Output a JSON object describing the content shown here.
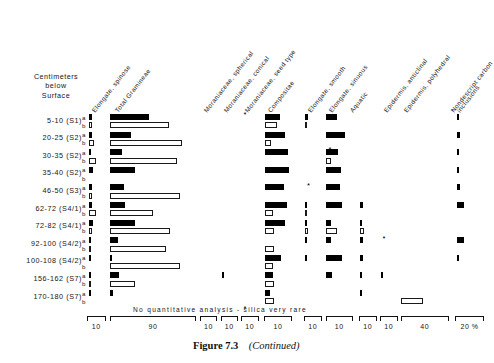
{
  "figure": {
    "caption_label": "Figure 7.3",
    "caption_note": "(Continued)",
    "axis_title": "Centimeters\nbelow\nSurface",
    "axis_title_lines": [
      "Centimeters",
      "below",
      "Surface"
    ],
    "note": "No quantitative analysis - silica very rare",
    "percent_symbol": "%",
    "sub_row_a": "a",
    "sub_row_b": "b"
  },
  "chart_data": {
    "type": "bar",
    "xlabel": "%",
    "ylabel": "Centimeters below Surface",
    "orientation": "horizontal",
    "grid": false,
    "legend": "none",
    "note": "No quantitative analysis - silica very rare",
    "series_note": "Each depth has two sub-samples: a (filled bars) and b (open bars). Values are percent; each column has its own scale given by the bracket width/label beneath it.",
    "columns": [
      {
        "name": "Elongate, spinose",
        "scale_max": 10,
        "bracket_label": "10"
      },
      {
        "name": "Total Gramineae",
        "scale_max": 90,
        "bracket_label": "90"
      },
      {
        "name": "Moraniaceae, spherical",
        "scale_max": 10,
        "bracket_label": "10"
      },
      {
        "name": "Moraniaceae, conical",
        "scale_max": 10,
        "bracket_label": "10"
      },
      {
        "name": "Moraniaceae, seed type",
        "scale_max": 10,
        "bracket_label": "10"
      },
      {
        "name": "Compositae",
        "scale_max": 10,
        "bracket_label": "10"
      },
      {
        "name": "Elongate, smooth",
        "scale_max": 10,
        "bracket_label": "10"
      },
      {
        "name": "Elongate, sinuous",
        "scale_max": 10,
        "bracket_label": "10"
      },
      {
        "name": "Aquatic",
        "scale_max": 10,
        "bracket_label": "10"
      },
      {
        "name": "Epidermis, anticlinal",
        "scale_max": 10,
        "bracket_label": "10"
      },
      {
        "name": "Epidermis, polyhedral",
        "scale_max": 40,
        "bracket_label": "40"
      },
      {
        "name": "Nondescript carbon inclusions",
        "scale_max": 20,
        "bracket_label": "20"
      }
    ],
    "categories": [
      "5-10 (S1)",
      "20-25 (S2)",
      "30-35 (S2)",
      "35-40 (S2)",
      "46-50 (S3)",
      "62-72 (S4/1)",
      "72-82 (S4/1)",
      "92-100 (S4/2)",
      "100-108 (S4/2)",
      "156-162 (S7)",
      "170-180 (S7)"
    ],
    "series": [
      {
        "name": "a",
        "style": "filled",
        "rows": [
          {
            "category": "5-10 (S1)",
            "values": [
              2.0,
              41,
              0,
              0,
              null,
              5.5,
              1.6,
              4.2,
              0,
              0,
              0,
              1.8
            ]
          },
          {
            "category": "20-25 (S2)",
            "values": [
              2.0,
              22,
              0,
              0,
              0,
              7.5,
              0,
              7.0,
              0,
              0,
              0,
              2.6
            ]
          },
          {
            "category": "30-35 (S2)",
            "values": [
              1.6,
              13,
              0,
              0,
              0,
              8.5,
              null,
              4.5,
              0,
              0,
              0,
              1.7
            ]
          },
          {
            "category": "35-40 (S2)",
            "values": [
              2.6,
              26,
              0,
              0,
              0,
              9.0,
              0,
              5.5,
              0,
              0,
              0,
              1.4
            ]
          },
          {
            "category": "46-50 (S3)",
            "values": [
              1.8,
              15,
              0,
              0,
              null,
              7.0,
              0,
              5.0,
              0,
              0,
              0,
              2.2
            ]
          },
          {
            "category": "62-72 (S4/1)",
            "values": [
              1.9,
              16,
              0,
              0,
              0,
              8.0,
              1.5,
              6.0,
              1.6,
              0,
              0,
              5.0
            ]
          },
          {
            "category": "72-82 (S4/1)",
            "values": [
              2.6,
              26,
              0,
              0,
              0,
              7.5,
              1.4,
              1.7,
              1.5,
              null,
              0,
              0
            ]
          },
          {
            "category": "92-100 (S4/2)",
            "values": [
              1.5,
              8,
              0,
              0,
              0,
              0,
              1.5,
              2.0,
              1.6,
              null,
              0,
              5.2
            ]
          },
          {
            "category": "100-108 (S4/2)",
            "values": [
              1.0,
              2,
              0,
              0,
              0,
              6.0,
              1.5,
              6.0,
              1.6,
              0,
              0,
              1.8
            ]
          },
          {
            "category": "156-162 (S7)",
            "values": [
              1.4,
              9,
              0,
              1.0,
              0,
              3.0,
              0,
              2.2,
              1.2,
              1.4,
              0,
              0
            ]
          },
          {
            "category": "170-180 (S7)",
            "values": [
              1.2,
              3,
              0,
              0,
              null,
              1.8,
              0,
              0,
              1.2,
              0,
              0,
              0
            ]
          }
        ]
      },
      {
        "name": "b",
        "style": "open",
        "rows": [
          {
            "category": "5-10 (S1)",
            "values": [
              2.0,
              61,
              0,
              0,
              0,
              4.5,
              1.4,
              0,
              0,
              0,
              0,
              0
            ]
          },
          {
            "category": "20-25 (S2)",
            "values": [
              3.0,
              75,
              0,
              0,
              0,
              2.2,
              0,
              0,
              0,
              0,
              0,
              0
            ]
          },
          {
            "category": "30-35 (S2)",
            "values": [
              4.2,
              70,
              0,
              0,
              0,
              0,
              0,
              2.0,
              0,
              0,
              0,
              0
            ]
          },
          {
            "category": "35-40 (S2)",
            "values": [
              0,
              0,
              0,
              0,
              0,
              0,
              0,
              0,
              0,
              0,
              0,
              0
            ]
          },
          {
            "category": "46-50 (S3)",
            "values": [
              2.0,
              73,
              0,
              0,
              0,
              0,
              0,
              0,
              0,
              0,
              0,
              0
            ]
          },
          {
            "category": "62-72 (S4/1)",
            "values": [
              3.8,
              45,
              0,
              0,
              0,
              3.0,
              1.5,
              0,
              0,
              0,
              0,
              0
            ]
          },
          {
            "category": "72-82 (S4/1)",
            "values": [
              2.0,
              63,
              0,
              0,
              0,
              3.5,
              1.6,
              4.0,
              2.5,
              0,
              0,
              0
            ]
          },
          {
            "category": "92-100 (S4/2)",
            "values": [
              1.2,
              58,
              0,
              0,
              0,
              3.5,
              0,
              0,
              0,
              0,
              0,
              0
            ]
          },
          {
            "category": "100-108 (S4/2)",
            "values": [
              0,
              73,
              0,
              0,
              0,
              3.0,
              0,
              0,
              0,
              0,
              0,
              0
            ]
          },
          {
            "category": "156-162 (S7)",
            "values": [
              1.2,
              26,
              0,
              0,
              0,
              3.5,
              0,
              0,
              0,
              0,
              0,
              0
            ]
          },
          {
            "category": "170-180 (S7)",
            "values": [
              0,
              0,
              0,
              0,
              0,
              3.5,
              0,
              0,
              0,
              0,
              18,
              0
            ]
          }
        ]
      }
    ],
    "markers": [
      {
        "symbol": "*",
        "column": "Moraniaceae, seed type",
        "category": "5-10 (S1)",
        "row": "a"
      },
      {
        "symbol": "*",
        "column": "Elongate, smooth",
        "category": "46-50 (S3)",
        "row": "a"
      },
      {
        "symbol": "*",
        "column": "Elongate, sinuous",
        "category": "30-35 (S2)",
        "row": "a"
      },
      {
        "symbol": "*",
        "column": "Epidermis, anticlinal",
        "category": "92-100 (S4/2)",
        "row": "a"
      },
      {
        "symbol": "*",
        "column": "Moraniaceae, seed type",
        "category": "170-180 (S7)",
        "row": "a"
      }
    ]
  },
  "header_labels": [
    "Elongate, spinose",
    "Total Gramineae",
    "Moraniaceae, spherical",
    "Moraniaceae, conical",
    "Moraniaceae, seed type",
    "Compositae",
    "Elongate, smooth",
    "Elongate, sinuous",
    "Aquatic",
    "Epidermis, anticlinal",
    "Epidermis, polyhedral",
    "Nondescript  carbon",
    "inclusions"
  ],
  "bracket_labels": [
    "10",
    "90",
    "10",
    "10",
    "10",
    "10",
    "10",
    "10",
    "10",
    "10",
    "40",
    "20 %"
  ]
}
